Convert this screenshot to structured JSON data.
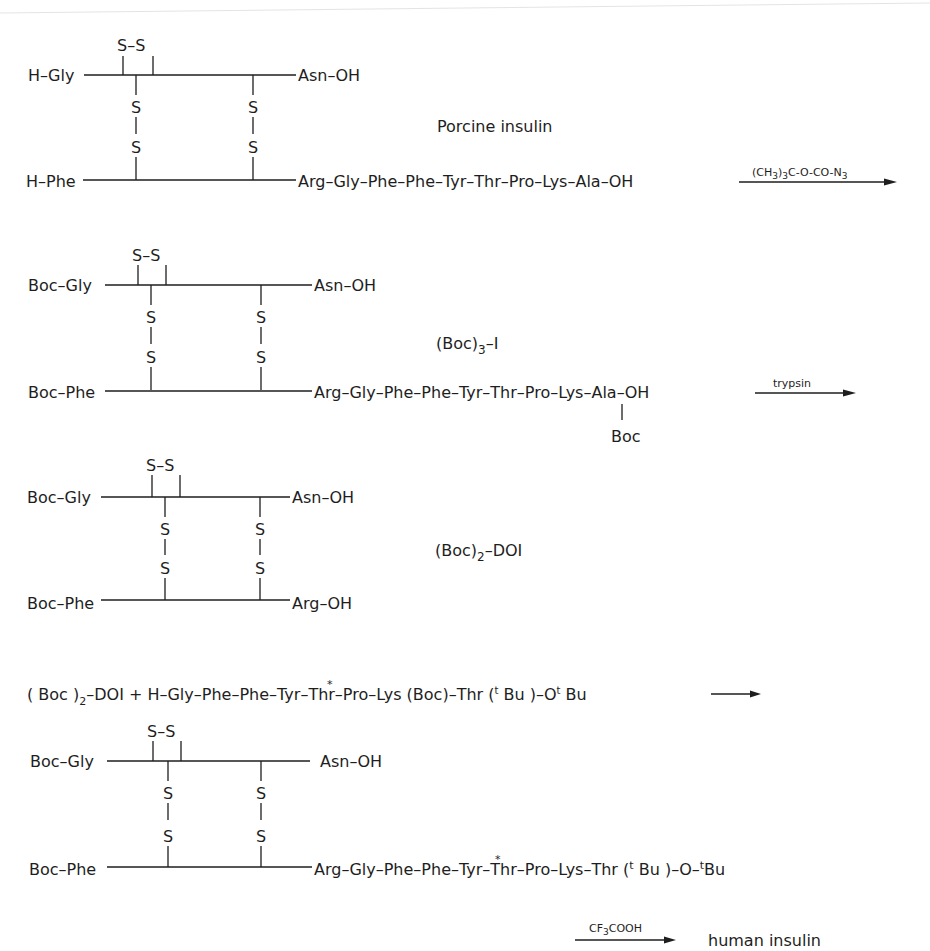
{
  "diagram": {
    "colors": {
      "ink": "#1e1e1e",
      "background": "#ffffff"
    },
    "structures": [
      {
        "id": "porcine-insulin",
        "name": "Porcine insulin",
        "a_chain_n": "H-Gly",
        "a_chain_c": "Asn-OH",
        "b_chain_n": "H-Phe",
        "b_chain_c": "Arg-Gly-Phe-Phe-Tyr-Thr-Pro-Lys-Ala-OH",
        "intrachain_disulfide": "S-S",
        "interchain_disulfides": [
          "S-S",
          "S-S"
        ]
      },
      {
        "id": "boc3-insulin",
        "name": "(Boc)3-I",
        "name_main": "(Boc)",
        "name_sub": "3",
        "name_tail": "-I",
        "a_chain_n": "Boc-Gly",
        "a_chain_c": "Asn-OH",
        "b_chain_n": "Boc-Phe",
        "b_chain_c": "Arg-Gly-Phe-Phe-Tyr-Thr-Pro-Lys-Ala-OH",
        "lys_protecting_group": "Boc"
      },
      {
        "id": "boc2-doi",
        "name": "(Boc)2-DOI",
        "name_main": "(Boc)",
        "name_sub": "2",
        "name_tail": "-DOI",
        "a_chain_n": "Boc-Gly",
        "a_chain_c": "Asn-OH",
        "b_chain_n": "Boc-Phe",
        "b_chain_c": "Arg-OH"
      },
      {
        "id": "protected-human-insulin",
        "a_chain_n": "Boc-Gly",
        "a_chain_c": "Asn-OH",
        "b_chain_n": "Boc-Phe",
        "b_chain_c": "Arg-Gly-Phe-Phe-Tyr*-Thr-Pro-Lys-Thr(tBu)-O-tBu"
      }
    ],
    "reagents": [
      {
        "step": 1,
        "label": "(CH3)3C-O-CO-N3"
      },
      {
        "step": 2,
        "label": "trypsin"
      },
      {
        "step": 3,
        "label": "coupling"
      },
      {
        "step": 4,
        "label": "CF3COOH"
      }
    ],
    "coupling_equation": "(Boc)2-DOI + H-Gly-Phe-Phe-Tyr*-Thr-Pro-Lys(Boc)-Thr(tBu)-OtBu",
    "final_product": "human insulin",
    "text": {
      "s": "S",
      "ss": "S–S",
      "hgly": "H–Gly",
      "hphe": "H–Phe",
      "bocgly": "Boc–Gly",
      "bocphe": "Boc–Phe",
      "asn": "Asn–OH",
      "asn_spaced": "A sn–OH",
      "argoh": "Arg–OH",
      "bchain_ala": "Arg–Gly–Phe–Phe–Tyr–Thr–Pro–Lys–Ala–OH",
      "bchain_boc_pre": "Arg–Gly–Phe–Phe–Tyr–Thr–Pro–",
      "lys": "Lys",
      "ala_oh": "–Ala–OH",
      "boc": "Boc",
      "porcine": "Porcine insulin",
      "boc3_main": "(Boc)",
      "boc3_sub": "3",
      "boc3_tail": "–I",
      "boc2_main": "(Boc)",
      "boc2_sub": "2",
      "boc2_tail": "–DOI",
      "r1_a": "(CH",
      "r1_sub1": "3",
      "r1_b": ")",
      "r1_sub2": "3",
      "r1_c": "C-O-CO-N",
      "r1_sub3": "3",
      "r2": "trypsin",
      "r4_a": "CF",
      "r4_sub": "3",
      "r4_b": "COOH",
      "final": "human insulin",
      "eq_a": "( Boc )",
      "eq_sub": "2",
      "eq_b": "–DOI + H–Gly–Phe–Phe–",
      "tyr": "Tyr",
      "star": "*",
      "eq_c": "–Thr–Pro–Lys (Boc)–Thr (",
      "t": "t",
      "eq_d": " Bu )–O",
      "eq_e": " Bu",
      "p4_a": "Arg–Gly–Phe–Phe–",
      "p4_b": "–Thr–Pro–Lys–Thr (",
      "p4_c": " Bu )–O–",
      "p4_d": "Bu"
    }
  }
}
